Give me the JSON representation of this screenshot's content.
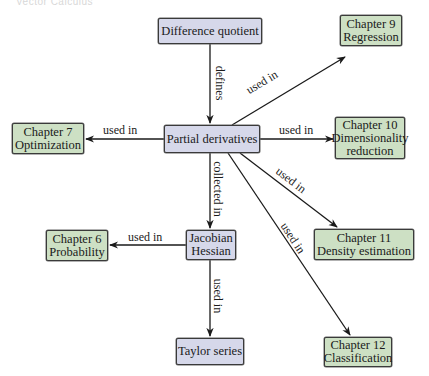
{
  "header": {
    "faint_text": "Vector Calculus"
  },
  "colors": {
    "concept_fill": "#d6d8ea",
    "chapter_fill": "#cde0c4",
    "border": "#3a3a3a",
    "edge": "#1a1a1a"
  },
  "nodes": {
    "difference_quotient": {
      "line1": "Difference quotient",
      "type": "concept"
    },
    "partial_derivatives": {
      "line1": "Partial derivatives",
      "type": "concept"
    },
    "jacobian_hessian": {
      "line1": "Jacobian",
      "line2": "Hessian",
      "type": "concept"
    },
    "taylor_series": {
      "line1": "Taylor series",
      "type": "concept"
    },
    "ch9": {
      "line1": "Chapter 9",
      "line2": "Regression",
      "type": "chapter"
    },
    "ch7": {
      "line1": "Chapter 7",
      "line2": "Optimization",
      "type": "chapter"
    },
    "ch10": {
      "line1": "Chapter 10",
      "line2": "Dimensionality",
      "line3": "reduction",
      "type": "chapter"
    },
    "ch6": {
      "line1": "Chapter 6",
      "line2": "Probability",
      "type": "chapter"
    },
    "ch11": {
      "line1": "Chapter 11",
      "line2": "Density estimation",
      "type": "chapter"
    },
    "ch12": {
      "line1": "Chapter 12",
      "line2": "Classification",
      "type": "chapter"
    }
  },
  "edges": [
    {
      "from": "Difference quotient",
      "to": "Partial derivatives",
      "label": "defines"
    },
    {
      "from": "Partial derivatives",
      "to": "Chapter 9 Regression",
      "label": "used in"
    },
    {
      "from": "Partial derivatives",
      "to": "Chapter 7 Optimization",
      "label": "used in"
    },
    {
      "from": "Partial derivatives",
      "to": "Chapter 10 Dimensionality reduction",
      "label": "used in"
    },
    {
      "from": "Partial derivatives",
      "to": "Jacobian Hessian",
      "label": "collected in"
    },
    {
      "from": "Partial derivatives",
      "to": "Chapter 11 Density estimation",
      "label": "used in"
    },
    {
      "from": "Partial derivatives",
      "to": "Chapter 12 Classification",
      "label": "used in"
    },
    {
      "from": "Jacobian Hessian",
      "to": "Chapter 6 Probability",
      "label": "used in"
    },
    {
      "from": "Jacobian Hessian",
      "to": "Taylor series",
      "label": "used in"
    }
  ]
}
